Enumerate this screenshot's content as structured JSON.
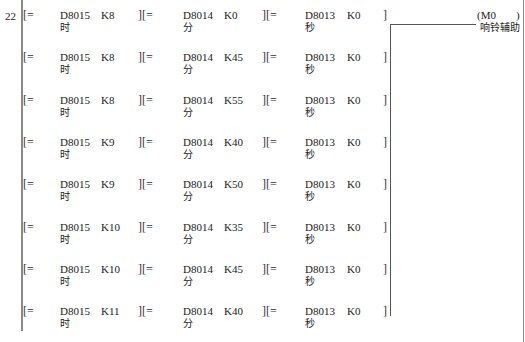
{
  "step_number": "22",
  "rungs": [
    {
      "op1": "[=",
      "dev1": "D8015",
      "cmt1": "时",
      "k1": "K8",
      "op2": "][=",
      "dev2": "D8014",
      "cmt2": "分",
      "k2": "K0",
      "op3": "][=",
      "dev3": "D8013",
      "cmt3": "秒",
      "k3": "K0",
      "close": "]"
    },
    {
      "op1": "[=",
      "dev1": "D8015",
      "cmt1": "时",
      "k1": "K8",
      "op2": "][=",
      "dev2": "D8014",
      "cmt2": "分",
      "k2": "K45",
      "op3": "][=",
      "dev3": "D8013",
      "cmt3": "秒",
      "k3": "K0",
      "close": "]"
    },
    {
      "op1": "[=",
      "dev1": "D8015",
      "cmt1": "时",
      "k1": "K8",
      "op2": "][=",
      "dev2": "D8014",
      "cmt2": "分",
      "k2": "K55",
      "op3": "][=",
      "dev3": "D8013",
      "cmt3": "秒",
      "k3": "K0",
      "close": "]"
    },
    {
      "op1": "[=",
      "dev1": "D8015",
      "cmt1": "时",
      "k1": "K9",
      "op2": "][=",
      "dev2": "D8014",
      "cmt2": "分",
      "k2": "K40",
      "op3": "][=",
      "dev3": "D8013",
      "cmt3": "秒",
      "k3": "K0",
      "close": "]"
    },
    {
      "op1": "[=",
      "dev1": "D8015",
      "cmt1": "时",
      "k1": "K9",
      "op2": "][=",
      "dev2": "D8014",
      "cmt2": "分",
      "k2": "K50",
      "op3": "][=",
      "dev3": "D8013",
      "cmt3": "秒",
      "k3": "K0",
      "close": "]"
    },
    {
      "op1": "[=",
      "dev1": "D8015",
      "cmt1": "时",
      "k1": "K10",
      "op2": "][=",
      "dev2": "D8014",
      "cmt2": "分",
      "k2": "K35",
      "op3": "][=",
      "dev3": "D8013",
      "cmt3": "秒",
      "k3": "K0",
      "close": "]"
    },
    {
      "op1": "[=",
      "dev1": "D8015",
      "cmt1": "时",
      "k1": "K10",
      "op2": "][=",
      "dev2": "D8014",
      "cmt2": "分",
      "k2": "K45",
      "op3": "][=",
      "dev3": "D8013",
      "cmt3": "秒",
      "k3": "K0",
      "close": "]"
    },
    {
      "op1": "[=",
      "dev1": "D8015",
      "cmt1": "时",
      "k1": "K11",
      "op2": "][=",
      "dev2": "D8014",
      "cmt2": "分",
      "k2": "K40",
      "op3": "][=",
      "dev3": "D8013",
      "cmt3": "秒",
      "k3": "K0",
      "close": "]"
    }
  ],
  "coil": {
    "open": "(M0",
    "close": ")",
    "comment": "响铃辅助"
  }
}
